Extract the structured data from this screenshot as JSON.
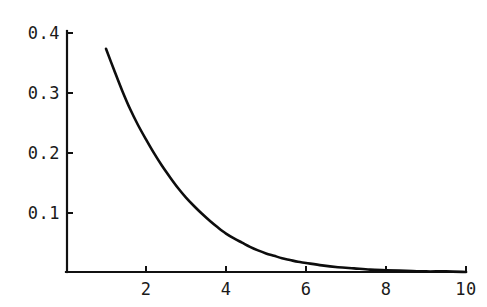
{
  "chart_data": {
    "type": "line",
    "title": "",
    "subtitle": "",
    "xlabel": "",
    "ylabel": "",
    "xlim": [
      0,
      10
    ],
    "ylim": [
      0,
      0.4
    ],
    "grid": false,
    "legend": null,
    "annotations": [],
    "x_ticks": [
      {
        "value": 2,
        "label": "2"
      },
      {
        "value": 4,
        "label": "4"
      },
      {
        "value": 6,
        "label": "6"
      },
      {
        "value": 8,
        "label": "8"
      },
      {
        "value": 10,
        "label": "10"
      }
    ],
    "y_ticks": [
      {
        "value": 0.1,
        "label": "0.1"
      },
      {
        "value": 0.2,
        "label": "0.2"
      },
      {
        "value": 0.3,
        "label": "0.3"
      },
      {
        "value": 0.4,
        "label": "0.4"
      }
    ],
    "series": [
      {
        "name": "decay-curve",
        "color": "#0d0d0d",
        "x": [
          1.0,
          1.2,
          1.4,
          1.6,
          1.8,
          2.0,
          2.2,
          2.4,
          2.6,
          2.8,
          3.0,
          3.2,
          3.4,
          3.6,
          3.8,
          4.0,
          4.2,
          4.4,
          4.6,
          4.8,
          5.0,
          5.2,
          5.4,
          5.6,
          5.8,
          6.0,
          6.4,
          6.8,
          7.2,
          7.6,
          8.0,
          8.5,
          9.0,
          9.5,
          10.0
        ],
        "y": [
          0.372,
          0.337,
          0.303,
          0.272,
          0.245,
          0.221,
          0.198,
          0.177,
          0.158,
          0.14,
          0.124,
          0.11,
          0.097,
          0.085,
          0.074,
          0.064,
          0.056,
          0.049,
          0.042,
          0.036,
          0.031,
          0.027,
          0.023,
          0.02,
          0.017,
          0.015,
          0.011,
          0.008,
          0.006,
          0.004,
          0.003,
          0.002,
          0.001,
          0.001,
          0.0
        ]
      }
    ]
  },
  "axis": {
    "x_axis_name": "x-axis",
    "y_axis_name": "y-axis"
  },
  "colors": {
    "background": "#ffffff",
    "axis": "#111111",
    "curve": "#0d0d0d",
    "text": "#1a1a1a"
  }
}
